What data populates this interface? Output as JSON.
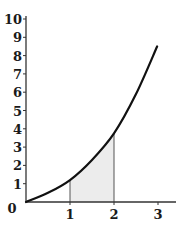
{
  "chart_data": {
    "type": "line",
    "title": "",
    "xlabel": "",
    "ylabel": "",
    "xlim": [
      0,
      3.3
    ],
    "ylim": [
      0,
      10
    ],
    "x_ticks": [
      "1",
      "2",
      "3"
    ],
    "y_ticks": [
      "0",
      "1",
      "2",
      "3",
      "4",
      "5",
      "6",
      "7",
      "8",
      "9",
      "10"
    ],
    "grid": false,
    "legend": null,
    "series": [
      {
        "name": "curve",
        "x": [
          0,
          0.5,
          1,
          1.5,
          2,
          2.5,
          2.98
        ],
        "y": [
          0,
          0.5,
          1.2,
          2.3,
          3.75,
          5.9,
          8.5
        ]
      }
    ],
    "shaded_region": {
      "x_from": 1,
      "x_to": 2,
      "under": "curve",
      "color": "#ececec"
    },
    "colors": {
      "curve": "#111111",
      "axes": "#333333",
      "shade": "#ececec"
    }
  }
}
